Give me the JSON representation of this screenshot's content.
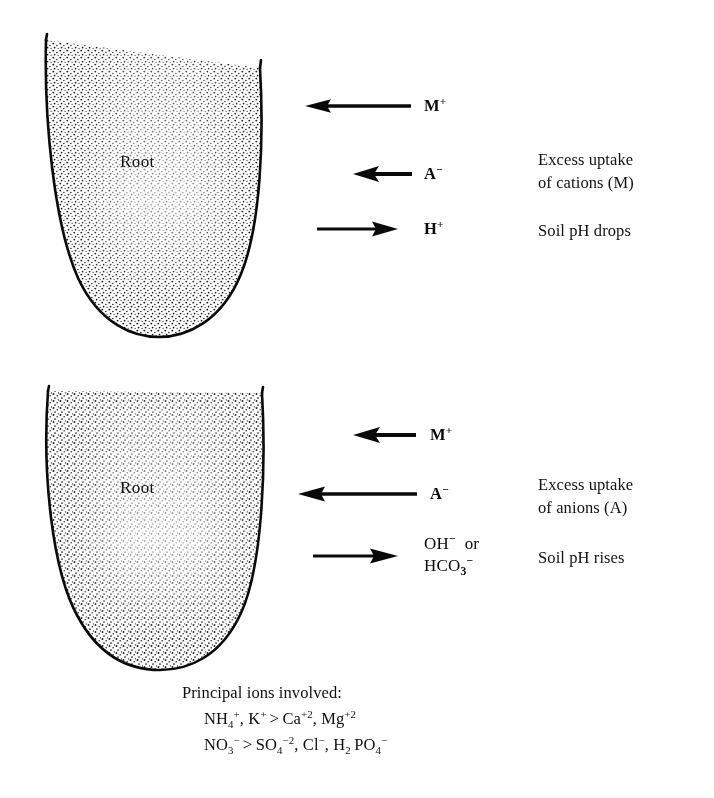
{
  "figure": {
    "background_color": "#ffffff",
    "ink_color": "#0a0a0a"
  },
  "panels": [
    {
      "id": "top-panel",
      "root_label": "Root",
      "fluxes": [
        {
          "id": "m-plus",
          "ion": "M",
          "charge": "+",
          "direction": "left",
          "arrow_length_px": 105
        },
        {
          "id": "a-minus",
          "ion": "A",
          "charge": "−",
          "direction": "left",
          "arrow_length_px": 56
        },
        {
          "id": "h-plus",
          "ion": "H",
          "charge": "+",
          "direction": "right",
          "arrow_length_px": 78
        }
      ],
      "notes": [
        {
          "id": "uptake-note",
          "text": "Excess uptake\nof cations (M)"
        },
        {
          "id": "ph-note",
          "text": "Soil pH drops"
        }
      ]
    },
    {
      "id": "bottom-panel",
      "root_label": "Root",
      "fluxes": [
        {
          "id": "m-plus",
          "ion": "M",
          "charge": "+",
          "direction": "left",
          "arrow_length_px": 62
        },
        {
          "id": "a-minus",
          "ion": "A",
          "charge": "−",
          "direction": "left",
          "arrow_length_px": 118
        },
        {
          "id": "oh-minus",
          "ion": "OH",
          "charge": "−",
          "direction": "right",
          "arrow_length_px": 82
        }
      ],
      "notes": [
        {
          "id": "uptake-note",
          "text": "Excess uptake\nof anions (A)"
        },
        {
          "id": "ph-note",
          "text": "Soil pH rises"
        }
      ]
    }
  ],
  "ion_labels": {
    "top": {
      "m_plus": "M",
      "m_plus_sup": "+",
      "a_minus": "A",
      "a_minus_sup": "−",
      "h_plus": "H",
      "h_plus_sup": "+"
    },
    "bottom": {
      "m_plus": "M",
      "m_plus_sup": "+",
      "a_minus": "A",
      "a_minus_sup": "−",
      "oh_line1_base": "OH",
      "oh_line1_sup": "−",
      "oh_line1_or": "or",
      "oh_line2_base1": "HCO",
      "oh_line2_sub": "3",
      "oh_line2_sup": "−"
    }
  },
  "caption": {
    "title": "Principal ions involved:",
    "cations": {
      "parts": [
        {
          "base": "NH",
          "sub": "4",
          "sup": "+"
        },
        {
          "sep": ", "
        },
        {
          "base": "K",
          "sup": "+"
        },
        {
          "gt": ">"
        },
        {
          "base": "Ca",
          "sup": "+2"
        },
        {
          "sep": ", "
        },
        {
          "base": "Mg",
          "sup": "+2"
        }
      ]
    },
    "anions": {
      "parts": [
        {
          "base": "NO",
          "sub": "3",
          "sup": "−"
        },
        {
          "gt": ">"
        },
        {
          "base": "SO",
          "sub": "4",
          "sup": "−2"
        },
        {
          "sep": ", "
        },
        {
          "base": "Cl",
          "sup": "−"
        },
        {
          "sep": ", "
        },
        {
          "base": "H",
          "sub": "2",
          "base2": "PO",
          "sub2": "4",
          "sup": "−"
        }
      ]
    }
  }
}
